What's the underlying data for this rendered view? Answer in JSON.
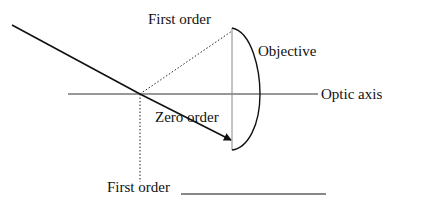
{
  "diagram": {
    "type": "optics-ray-diagram",
    "labels": {
      "first_order_top": "First order",
      "objective": "Objective",
      "optic_axis": "Optic axis",
      "zero_order": "Zero order",
      "first_order_bottom": "First order"
    },
    "colors": {
      "line": "#111111",
      "axis": "#333333",
      "lens_flat": "#888888",
      "background": "#ffffff"
    },
    "elements": [
      {
        "id": "incident-ray",
        "style": "solid",
        "from": [
          12,
          25
        ],
        "to": [
          140,
          94
        ]
      },
      {
        "id": "zero-order-ray",
        "style": "solid-arrow",
        "from": [
          140,
          94
        ],
        "to": [
          232,
          140
        ]
      },
      {
        "id": "first-order-up",
        "style": "dotted",
        "from": [
          140,
          94
        ],
        "to": [
          232,
          31
        ]
      },
      {
        "id": "first-order-down",
        "style": "dotted",
        "from": [
          140,
          94
        ],
        "to": [
          140,
          182
        ]
      },
      {
        "id": "optic-axis",
        "style": "solid",
        "from": [
          68,
          94
        ],
        "to": [
          318,
          94
        ]
      },
      {
        "id": "objective-lens",
        "shape": "plano-convex",
        "flat_x": 232,
        "top_y": 28,
        "bottom_y": 150,
        "max_bulge_x": 260
      },
      {
        "id": "answer-blank",
        "style": "solid",
        "from": [
          181,
          194
        ],
        "to": [
          326,
          194
        ]
      }
    ]
  }
}
